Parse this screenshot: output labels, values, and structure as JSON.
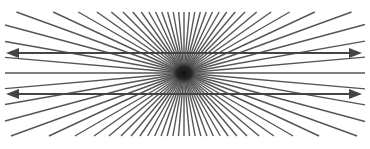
{
  "figure": {
    "type": "hering-illusion",
    "width": 370,
    "height": 149,
    "background": "#ffffff",
    "center": {
      "x": 184,
      "y": 73
    },
    "ray_bounds": {
      "left": 5,
      "right": 365,
      "top": 12,
      "bottom": 136
    },
    "ray_angle_step_deg": 5,
    "ray_color": "#555555",
    "ray_width": 1.4,
    "center_blob_color": "#1a1a1a",
    "center_blob_rx": 14,
    "center_blob_ry": 12,
    "arrows": [
      {
        "y": 53,
        "x1": 6,
        "x2": 362,
        "color": "#444444"
      },
      {
        "y": 94,
        "x1": 6,
        "x2": 362,
        "color": "#444444"
      }
    ]
  }
}
